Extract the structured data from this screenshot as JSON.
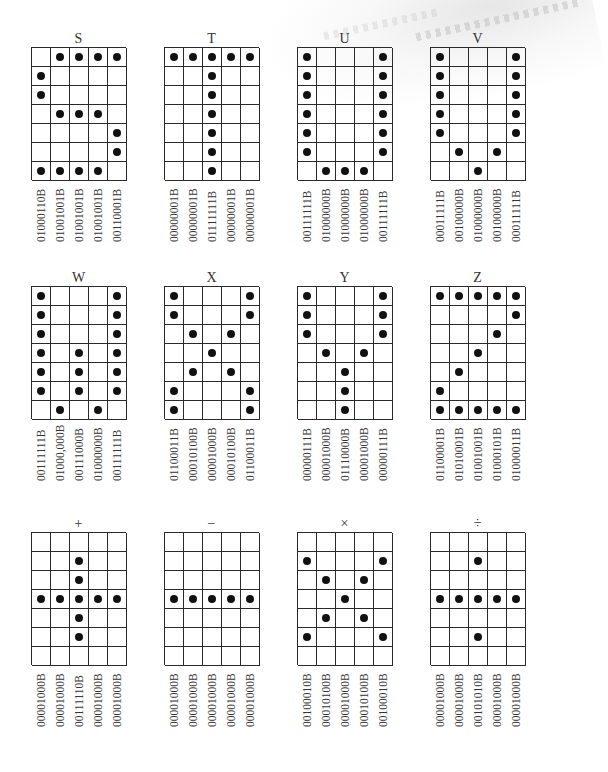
{
  "figure": {
    "panels": [
      {
        "title": "S",
        "rows": [
          ".XXXX",
          "X....",
          "X....",
          ".XXX.",
          "....X",
          "....X",
          "XXXX."
        ],
        "codes": [
          "01000110B",
          "01001001B",
          "01001001B",
          "01001001B",
          "00110001B"
        ]
      },
      {
        "title": "T",
        "rows": [
          "XXXXX",
          "..X..",
          "..X..",
          "..X..",
          "..X..",
          "..X..",
          "..X.."
        ],
        "codes": [
          "00000001B",
          "00000001B",
          "01111111B",
          "00000001B",
          "00000001B"
        ]
      },
      {
        "title": "U",
        "rows": [
          "X...X",
          "X...X",
          "X...X",
          "X...X",
          "X...X",
          "X...X",
          ".XXX."
        ],
        "codes": [
          "00111111B",
          "01000000B",
          "01000000B",
          "01000000B",
          "00111111B"
        ]
      },
      {
        "title": "V",
        "rows": [
          "X...X",
          "X...X",
          "X...X",
          "X...X",
          "X...X",
          ".X.X.",
          "..X.."
        ],
        "codes": [
          "00011111B",
          "00100000B",
          "01000000B",
          "00100000B",
          "00011111B"
        ]
      },
      {
        "title": "W",
        "rows": [
          "X...X",
          "X...X",
          "X...X",
          "X.X.X",
          "X.X.X",
          "X.X.X",
          ".X.X."
        ],
        "codes": [
          "00111111B",
          "01000,000B",
          "00111000B",
          "01000000B",
          "00111111B"
        ]
      },
      {
        "title": "X",
        "rows": [
          "X...X",
          "X...X",
          ".X.X.",
          "..X..",
          ".X.X.",
          "X...X",
          "X...X"
        ],
        "codes": [
          "01100011B",
          "00010100B",
          "00001000B",
          "00010100B",
          "01100011B"
        ]
      },
      {
        "title": "Y",
        "rows": [
          "X...X",
          "X...X",
          "X...X",
          ".X.X.",
          "..X..",
          "..X..",
          "..X.."
        ],
        "codes": [
          "00000111B",
          "00001000B",
          "01110000B",
          "00001000B",
          "00000111B"
        ]
      },
      {
        "title": "Z",
        "rows": [
          "XXXXX",
          "....X",
          "...X.",
          "..X..",
          ".X...",
          "X....",
          "XXXXX"
        ],
        "codes": [
          "01100001B",
          "01010001B",
          "01001001B",
          "01000101B",
          "01000011B"
        ]
      },
      {
        "title": "+",
        "rows": [
          ".....",
          "..X..",
          "..X..",
          "XXXXX",
          "..X..",
          "..X..",
          "....."
        ],
        "codes": [
          "00001000B",
          "00001000B",
          "00111110B",
          "00001000B",
          "00001000B"
        ]
      },
      {
        "title": "−",
        "rows": [
          ".....",
          ".....",
          ".....",
          "XXXXX",
          ".....",
          ".....",
          "....."
        ],
        "codes": [
          "00001000B",
          "00001000B",
          "00001000B",
          "00001000B",
          "00001000B"
        ]
      },
      {
        "title": "×",
        "rows": [
          ".....",
          "X...X",
          ".X.X.",
          "..X..",
          ".X.X.",
          "X...X",
          "....."
        ],
        "codes": [
          "00100010B",
          "00010100B",
          "00001000B",
          "00010100B",
          "00100010B"
        ]
      },
      {
        "title": "÷",
        "rows": [
          ".....",
          "..X..",
          ".....",
          "XXXXX",
          ".....",
          "..X..",
          "....."
        ],
        "codes": [
          "00001000B",
          "00001000B",
          "00101010B",
          "00001000B",
          "00001000B"
        ]
      }
    ]
  }
}
